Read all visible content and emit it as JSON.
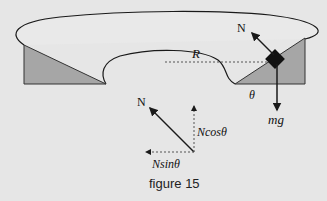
{
  "figure": {
    "caption": "figure 15",
    "labels": {
      "normal_top": "N",
      "radius": "R",
      "angle": "θ",
      "weight": "mg",
      "normal_bottom": "N",
      "n_cos": "Ncosθ",
      "n_sin": "Nsinθ"
    },
    "colors": {
      "background": "#e6e6e6",
      "surface": "#e8e8e8",
      "incline_fill": "#a6a6a6",
      "stroke": "#1a1a1a",
      "block": "#111111"
    }
  }
}
